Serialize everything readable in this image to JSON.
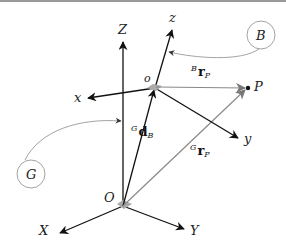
{
  "diagram": {
    "colors": {
      "axis": "#111111",
      "vector_gray": "#888888",
      "callout_gray": "#999999",
      "border": "#9a9a9a",
      "origin_marker": "#aaaaaa"
    },
    "global_frame": {
      "name": "G",
      "origin_label": "O",
      "axes": {
        "X": "X",
        "Y": "Y",
        "Z": "Z"
      }
    },
    "body_frame": {
      "name": "B",
      "origin_label": "o",
      "axes": {
        "x": "x",
        "y": "y",
        "z": "z"
      }
    },
    "point": {
      "label": "P"
    },
    "vectors": {
      "d_B": {
        "sup": "G",
        "main": "d",
        "sub": "B"
      },
      "r_P_global": {
        "sup": "G",
        "main": "r",
        "sub": "P"
      },
      "r_P_body": {
        "sup": "B",
        "main": "r",
        "sub": "P"
      }
    },
    "callouts": {
      "B": "B",
      "G": "G"
    }
  }
}
